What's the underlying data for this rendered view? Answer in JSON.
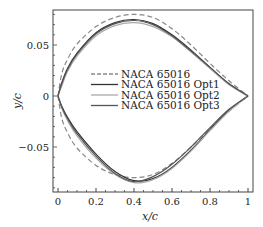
{
  "chart_data": {
    "type": "line",
    "title": "",
    "xlabel": "x/c",
    "ylabel": "y/c",
    "xlim": [
      -0.025,
      1.0
    ],
    "ylim": [
      -0.094,
      0.084
    ],
    "x_ticks": [
      "0",
      "0.2",
      "0.4",
      "0.6",
      "0.8",
      "1"
    ],
    "y_ticks": [
      "-0.05",
      "0",
      "0.05"
    ],
    "grid": false,
    "legend_position": "center-right",
    "series": [
      {
        "name": "NACA 65016",
        "style": "dashed",
        "color": "#888888",
        "upper": {
          "x": [
            0,
            0.02,
            0.05,
            0.1,
            0.2,
            0.3,
            0.4,
            0.5,
            0.6,
            0.7,
            0.8,
            0.9,
            1.0
          ],
          "y": [
            0,
            0.022,
            0.036,
            0.051,
            0.068,
            0.077,
            0.08,
            0.077,
            0.066,
            0.05,
            0.032,
            0.015,
            0
          ]
        },
        "lower": {
          "x": [
            0,
            0.02,
            0.05,
            0.1,
            0.2,
            0.3,
            0.4,
            0.5,
            0.6,
            0.7,
            0.8,
            0.9,
            1.0
          ],
          "y": [
            0,
            -0.022,
            -0.036,
            -0.051,
            -0.068,
            -0.077,
            -0.08,
            -0.077,
            -0.066,
            -0.05,
            -0.032,
            -0.015,
            0
          ]
        }
      },
      {
        "name": "NACA 65016 Opt1",
        "style": "solid",
        "color": "#333333",
        "upper": {
          "x": [
            0,
            0.02,
            0.05,
            0.1,
            0.2,
            0.3,
            0.4,
            0.5,
            0.6,
            0.7,
            0.8,
            0.9,
            1.0
          ],
          "y": [
            0,
            0.013,
            0.027,
            0.042,
            0.062,
            0.072,
            0.075,
            0.071,
            0.06,
            0.045,
            0.028,
            0.012,
            0
          ]
        },
        "lower": {
          "x": [
            0,
            0.02,
            0.05,
            0.1,
            0.2,
            0.3,
            0.4,
            0.5,
            0.6,
            0.7,
            0.8,
            0.9,
            1.0
          ],
          "y": [
            0,
            -0.01,
            -0.021,
            -0.035,
            -0.057,
            -0.074,
            -0.083,
            -0.081,
            -0.07,
            -0.053,
            -0.033,
            -0.014,
            0
          ]
        }
      },
      {
        "name": "NACA 65016 Opt2",
        "style": "solid",
        "color": "#aaaaaa",
        "upper": {
          "x": [
            0,
            0.02,
            0.05,
            0.1,
            0.2,
            0.3,
            0.4,
            0.5,
            0.6,
            0.7,
            0.8,
            0.9,
            1.0
          ],
          "y": [
            0,
            0.01,
            0.024,
            0.039,
            0.059,
            0.069,
            0.072,
            0.068,
            0.058,
            0.043,
            0.027,
            0.011,
            0
          ]
        },
        "lower": {
          "x": [
            0,
            0.02,
            0.05,
            0.1,
            0.2,
            0.3,
            0.4,
            0.5,
            0.6,
            0.7,
            0.8,
            0.9,
            1.0
          ],
          "y": [
            0,
            -0.012,
            -0.024,
            -0.039,
            -0.061,
            -0.077,
            -0.085,
            -0.082,
            -0.071,
            -0.054,
            -0.034,
            -0.015,
            0
          ]
        }
      },
      {
        "name": "NACA 65016 Opt3",
        "style": "solid",
        "color": "#555555",
        "upper": {
          "x": [
            0,
            0.02,
            0.05,
            0.1,
            0.2,
            0.3,
            0.4,
            0.5,
            0.6,
            0.7,
            0.8,
            0.9,
            1.0
          ],
          "y": [
            0,
            0.012,
            0.026,
            0.041,
            0.061,
            0.071,
            0.074,
            0.07,
            0.059,
            0.044,
            0.028,
            0.012,
            0
          ]
        },
        "lower": {
          "x": [
            0,
            0.02,
            0.05,
            0.1,
            0.2,
            0.3,
            0.4,
            0.5,
            0.6,
            0.7,
            0.8,
            0.9,
            1.0
          ],
          "y": [
            0,
            -0.011,
            -0.022,
            -0.037,
            -0.059,
            -0.076,
            -0.084,
            -0.079,
            -0.067,
            -0.05,
            -0.031,
            -0.013,
            0
          ]
        }
      }
    ]
  }
}
